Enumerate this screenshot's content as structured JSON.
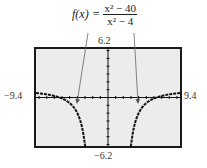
{
  "formula": {
    "lhs": "f(x)",
    "eq": "=",
    "numerator": "x² − 40",
    "denominator": "x² − 4"
  },
  "window": {
    "ymax_label": "6.2",
    "ymin_label": "−6.2",
    "xmin_label": "−9.4",
    "xmax_label": "9.4"
  },
  "chart_data": {
    "type": "line",
    "xlabel": "",
    "ylabel": "",
    "xlim": [
      -9.4,
      9.4
    ],
    "ylim": [
      -6.2,
      6.2
    ],
    "grid": false,
    "tick_spacing": 1,
    "vertical_asymptotes": [
      -2,
      2
    ],
    "horizontal_asymptote": 1,
    "series": [
      {
        "name": "f(x) left branch",
        "x": [
          -9.4,
          -8,
          -7,
          -6,
          -5,
          -4,
          -3.5,
          -3,
          -2.8,
          -2.6
        ],
        "y": [
          0.47,
          0.6,
          0.36,
          -0.13,
          -0.71,
          -2.0,
          -3.27,
          -6.2,
          -8.3,
          -11.8
        ]
      },
      {
        "name": "f(x) right branch",
        "x": [
          2.6,
          2.8,
          3,
          3.5,
          4,
          5,
          6,
          7,
          8,
          9.4
        ],
        "y": [
          -11.8,
          -8.3,
          -6.2,
          -3.27,
          -2.0,
          -0.71,
          -0.13,
          0.36,
          0.6,
          0.47
        ]
      }
    ],
    "annotations": [
      "Arrows from formula pointing to each branch of the graph"
    ]
  }
}
